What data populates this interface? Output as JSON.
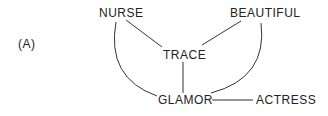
{
  "panel_label": "(A)",
  "nodes": {
    "nurse": "NURSE",
    "beautiful": "BEAUTIFUL",
    "trace": "TRACE",
    "glamor": "GLAMOR",
    "actress": "ACTRESS"
  },
  "edges": [
    {
      "from": "NURSE",
      "to": "TRACE",
      "style": "straight"
    },
    {
      "from": "BEAUTIFUL",
      "to": "TRACE",
      "style": "straight"
    },
    {
      "from": "TRACE",
      "to": "GLAMOR",
      "style": "straight"
    },
    {
      "from": "NURSE",
      "to": "GLAMOR",
      "style": "curved"
    },
    {
      "from": "BEAUTIFUL",
      "to": "GLAMOR",
      "style": "curved"
    },
    {
      "from": "GLAMOR",
      "to": "ACTRESS",
      "style": "straight"
    }
  ],
  "colors": {
    "line": "#333333",
    "text": "#222222",
    "background": "#ffffff"
  }
}
